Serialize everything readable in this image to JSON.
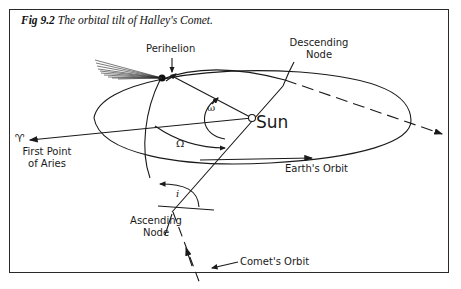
{
  "figure": {
    "number": "Fig 9.2",
    "title": "The orbital tilt of Halley's Comet."
  },
  "labels": {
    "perihelion": "Perihelion",
    "descending_node_line1": "Descending",
    "descending_node_line2": "Node",
    "sun": "Sun",
    "aries_symbol": "♈",
    "first_point_line1": "First Point",
    "first_point_line2": "of Aries",
    "ascending_node_line1": "Ascending",
    "ascending_node_line2": "Node",
    "earths_orbit": "Earth's Orbit",
    "comets_orbit": "Comet's Orbit",
    "omega_small": "ω",
    "omega_capital": "Ω",
    "inclination": "i"
  },
  "colors": {
    "ink": "#1a1a1a",
    "background": "#ffffff"
  }
}
